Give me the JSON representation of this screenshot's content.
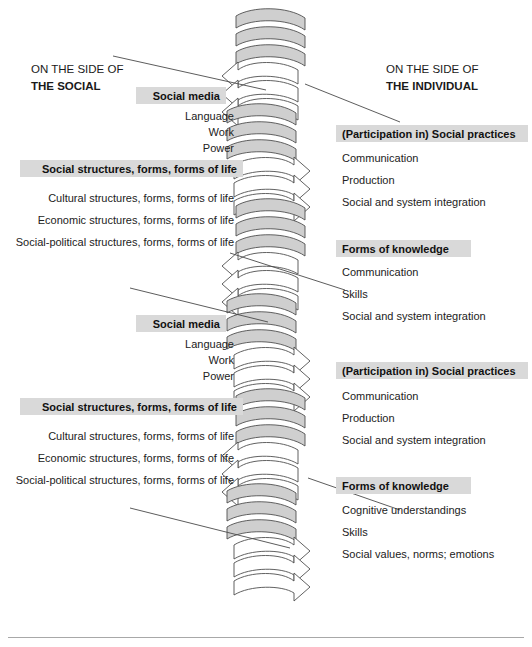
{
  "figure": {
    "left_caption_line1": "ON THE SIDE OF",
    "left_caption_line2": "THE SOCIAL",
    "right_caption_line1": "ON THE SIDE OF",
    "right_caption_line2": "THE INDIVIDUAL",
    "center_icon": "double-helix-arrows",
    "accent_highlight": "#d9d9d9",
    "band_fill": "#cfcfcf",
    "stroke": "#4f4f4f"
  },
  "left_blocks": [
    {
      "heading": "Social media",
      "items": [
        "Language",
        "Work",
        "Power"
      ]
    },
    {
      "heading": "Social structures, forms, forms of life",
      "items": [
        "Cultural structures, forms, forms of life",
        "Economic structures, forms, forms of life",
        "Social-political structures, forms, forms of life"
      ]
    },
    {
      "heading": "Social media",
      "items": [
        "Language",
        "Work",
        "Power"
      ]
    },
    {
      "heading": "Social structures, forms, forms of life",
      "items": [
        "Cultural structures, forms, forms of life",
        "Economic structures, forms, forms of life",
        "Social-political structures, forms, forms of life"
      ]
    }
  ],
  "right_blocks": [
    {
      "heading": "(Participation in) Social practices",
      "items": [
        "Communication",
        "Production",
        "Social and system integration"
      ]
    },
    {
      "heading": "Forms of knowledge",
      "items": [
        "Communication",
        "Skills",
        "Social and system integration"
      ]
    },
    {
      "heading": "(Participation in) Social practices",
      "items": [
        "Communication",
        "Production",
        "Social and system integration"
      ]
    },
    {
      "heading": "Forms of knowledge",
      "items": [
        "Cognitive understandings",
        "Skills",
        "Social values, norms; emotions"
      ]
    }
  ]
}
